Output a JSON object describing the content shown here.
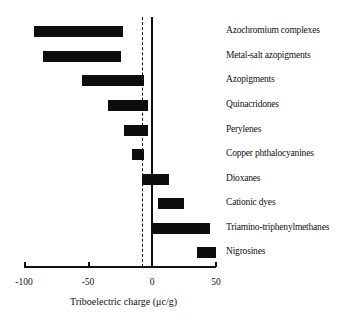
{
  "chart_data": {
    "type": "bar",
    "orientation": "horizontal",
    "style": "floating-range",
    "title": "",
    "xlabel": "Triboelectric charge (μc/g)",
    "ylabel": "",
    "xlim": [
      -100,
      50
    ],
    "xticks": [
      "-100",
      "-50",
      "0",
      "50"
    ],
    "reference_lines": [
      {
        "value": 0,
        "style": "solid"
      },
      {
        "value": -7,
        "style": "dashed"
      }
    ],
    "grid": false,
    "legend": null,
    "categories": [
      "Azochromium complexes",
      "Metal-salt  azopigments",
      "Azopigments",
      "Quinacridones",
      "Perylenes",
      "Copper phthalocyanines",
      "Dioxanes",
      "Cationic dyes",
      "Triamino-triphenylmethanes",
      "Nigrosines"
    ],
    "series": [
      {
        "name": "Charge range",
        "ranges": [
          [
            -92,
            -23
          ],
          [
            -85,
            -24
          ],
          [
            -55,
            -6
          ],
          [
            -34,
            -3
          ],
          [
            -22,
            -3
          ],
          [
            -16,
            -6
          ],
          [
            -8,
            13
          ],
          [
            5,
            25
          ],
          [
            0,
            45
          ],
          [
            35,
            50
          ]
        ]
      }
    ]
  },
  "axis": {
    "tick_labels": [
      "-100",
      "-50",
      "0",
      "50"
    ],
    "title": "Triboelectric charge (μc/g)"
  },
  "labels": [
    "Azochromium complexes",
    "Metal-salt  azopigments",
    "Azopigments",
    "Quinacridones",
    "Perylenes",
    "Copper phthalocyanines",
    "Dioxanes",
    "Cationic dyes",
    "Triamino-triphenylmethanes",
    "Nigrosines"
  ]
}
